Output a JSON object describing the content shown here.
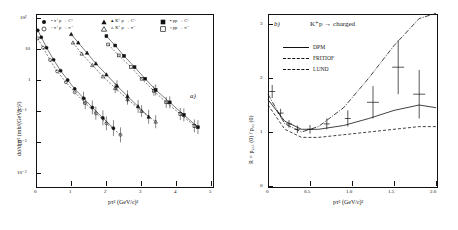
{
  "figure": {
    "panel_a_id": "a)",
    "panel_b_id": "b)"
  },
  "panel_a": {
    "ylabel": "dσ/dpᴛ²   (mb/(GeV/c)²)",
    "xlabel": "pᴛ²  (GeV/c)²",
    "ytick_labels": [
      "10²",
      "10",
      "1",
      "10⁻¹",
      "10⁻²",
      "10⁻³"
    ],
    "xtick_labels": [
      "0",
      "1",
      "2",
      "3",
      "4",
      "5"
    ],
    "legend_col1": [
      "•  π⁺p → C°",
      "◦  π⁺p → π⁻"
    ],
    "legend_col2": [
      "▴  K⁺p → C°",
      "▵  K⁺p → π⁻"
    ],
    "legend_col3": [
      "▪  pp → C°",
      "▫  pp → π⁻"
    ]
  },
  "panel_b": {
    "title": "K⁺p → charged",
    "ylabel": "R = p₂₅₅ (0) / p₃₅ (0)",
    "xlabel": "pᴛ²  (GeV/c)²",
    "ytick_labels": [
      "0",
      "1",
      "2",
      "3"
    ],
    "xtick_labels": [
      "0",
      "0.5",
      "1.0",
      "1.5",
      "2.0"
    ],
    "legend": [
      {
        "label": "DPM",
        "style": "solid"
      },
      {
        "label": "FRITIOF",
        "style": "dash-dot"
      },
      {
        "label": "LUND",
        "style": "dashed"
      }
    ]
  },
  "chart_data": [
    {
      "type": "scatter",
      "title": "a)",
      "xlabel": "p_T^2 (GeV/c)^2",
      "ylabel": "dσ/dp_T^2 (mb/(GeV/c)^2)",
      "xlim": [
        0,
        5
      ],
      "ylim": [
        0.001,
        200
      ],
      "yscale": "log",
      "grid": false,
      "legend_position": "top",
      "series": [
        {
          "name": "π⁺p → C°",
          "marker": "filled-circle",
          "x": [
            0.05,
            0.15,
            0.3,
            0.5,
            0.7,
            0.9,
            1.1,
            1.35,
            1.6,
            1.9,
            2.2
          ],
          "y": [
            40,
            24,
            11,
            4.5,
            2.0,
            1.0,
            0.52,
            0.26,
            0.13,
            0.06,
            0.028
          ]
        },
        {
          "name": "π⁺p → π⁻",
          "marker": "open-circle",
          "x": [
            0.05,
            0.2,
            0.4,
            0.6,
            0.85,
            1.1,
            1.4,
            1.7,
            2.0,
            2.4
          ],
          "y": [
            22,
            11,
            4.4,
            1.9,
            0.85,
            0.4,
            0.18,
            0.085,
            0.04,
            0.017
          ]
        },
        {
          "name": "K⁺p → C°",
          "marker": "filled-triangle",
          "x": [
            1.0,
            1.2,
            1.45,
            1.7,
            2.0,
            2.3,
            2.6,
            2.9,
            3.2
          ],
          "y": [
            30,
            16,
            7.5,
            3.4,
            1.5,
            0.65,
            0.3,
            0.14,
            0.065
          ]
        },
        {
          "name": "K⁺p → π⁻",
          "marker": "open-triangle",
          "x": [
            1.05,
            1.3,
            1.6,
            1.9,
            2.25,
            2.6,
            3.0,
            3.4
          ],
          "y": [
            16,
            7.0,
            3.0,
            1.3,
            0.55,
            0.24,
            0.1,
            0.045
          ]
        },
        {
          "name": "pp → C°",
          "marker": "filled-square",
          "x": [
            2.0,
            2.25,
            2.5,
            2.8,
            3.1,
            3.4,
            3.8,
            4.2,
            4.6
          ],
          "y": [
            26,
            13,
            6.0,
            2.6,
            1.1,
            0.48,
            0.19,
            0.075,
            0.03
          ]
        },
        {
          "name": "pp → π⁻",
          "marker": "open-square",
          "x": [
            2.05,
            2.35,
            2.7,
            3.0,
            3.35,
            3.7,
            4.1,
            4.5
          ],
          "y": [
            14,
            6.2,
            2.6,
            1.1,
            0.45,
            0.19,
            0.08,
            0.033
          ]
        }
      ]
    },
    {
      "type": "line",
      "title": "K⁺p → charged",
      "xlabel": "p_T^2 (GeV/c)^2",
      "ylabel": "R = p_255(0)/p_35(0)",
      "xlim": [
        0,
        2.0
      ],
      "ylim": [
        0,
        3.2
      ],
      "grid": false,
      "legend_position": "top-left",
      "data_points": {
        "name": "data",
        "x": [
          0.05,
          0.15,
          0.25,
          0.35,
          0.5,
          0.7,
          0.95,
          1.25,
          1.55,
          1.8
        ],
        "y": [
          1.75,
          1.35,
          1.15,
          1.05,
          1.05,
          1.15,
          1.25,
          1.55,
          2.2,
          1.7
        ],
        "yerr": [
          0.12,
          0.08,
          0.07,
          0.07,
          0.08,
          0.1,
          0.15,
          0.3,
          0.5,
          0.45
        ]
      },
      "series": [
        {
          "name": "DPM",
          "style": "solid",
          "x": [
            0.0,
            0.2,
            0.4,
            0.6,
            0.9,
            1.2,
            1.5,
            1.8,
            2.0
          ],
          "y": [
            1.6,
            1.2,
            1.05,
            1.05,
            1.12,
            1.25,
            1.4,
            1.5,
            1.45
          ]
        },
        {
          "name": "FRITIOF",
          "style": "dash-dot",
          "x": [
            0.0,
            0.2,
            0.4,
            0.6,
            0.9,
            1.2,
            1.5,
            1.8,
            2.0
          ],
          "y": [
            1.7,
            1.15,
            1.0,
            1.1,
            1.45,
            2.0,
            2.6,
            3.1,
            3.2
          ]
        },
        {
          "name": "LUND",
          "style": "dashed",
          "x": [
            0.0,
            0.2,
            0.4,
            0.6,
            0.9,
            1.2,
            1.5,
            1.8,
            2.0
          ],
          "y": [
            1.5,
            1.05,
            0.9,
            0.9,
            0.95,
            1.0,
            1.05,
            1.1,
            1.1
          ]
        }
      ]
    }
  ]
}
